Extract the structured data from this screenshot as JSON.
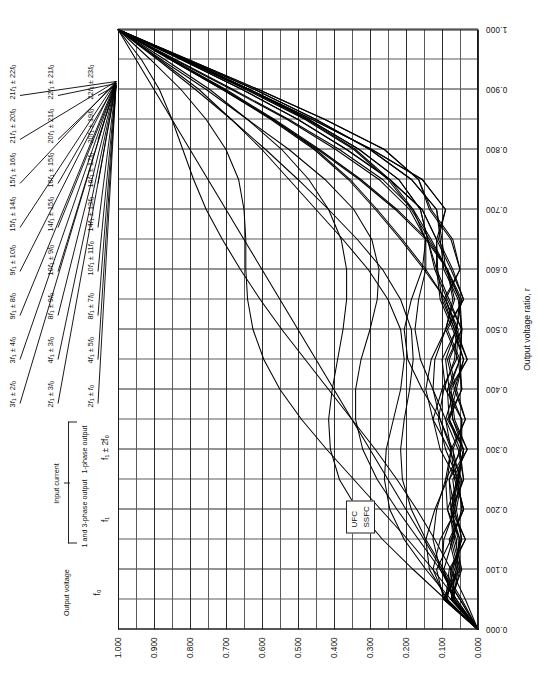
{
  "figure": {
    "orientation": "rotated-90",
    "background": "#ffffff",
    "line_color": "#000000",
    "grid_color": "#5a5a5a"
  },
  "header": {
    "output_voltage_title": "Output\noutput voltage",
    "output_voltage_label": "Output voltage",
    "output_voltage_symbol": "f₀",
    "input_current_label": "Input current",
    "input_current_col1_label": "1 and 3-phase output",
    "input_current_col1_symbol": "f₁",
    "input_current_col2_label": "1-phase output",
    "input_current_col2_symbol": "f₁ ± 2f₀"
  },
  "legend_box": {
    "line1": "UFC",
    "line2": "SSFC"
  },
  "axes": {
    "x_title": "Output voltage ratio, r",
    "x_ticks": [
      "0.000",
      "0.100",
      "0.200",
      "0.300",
      "0.400",
      "0.500",
      "0.600",
      "0.700",
      "0.800",
      "0.900",
      "1.000"
    ],
    "y_ticks": [
      "0.000",
      "0.100",
      "0.200",
      "0.300",
      "0.400",
      "0.500",
      "0.600",
      "0.700",
      "0.800",
      "0.900",
      "1.000"
    ],
    "x_range": [
      0,
      1
    ],
    "y_range": [
      0,
      1
    ]
  },
  "component_labels": {
    "column_left": [
      "3f₁ ± 2f₀",
      "3f₁ ± 4f₀",
      "9f₁ ± 8f₀",
      "9f₁ ± 10f₀",
      "15f₁ ± 14f₀",
      "15f₁ ± 16f₀",
      "21f₁ ± 20f₀",
      "21f₁ ± 22f₀"
    ],
    "column_middle": [
      "2f₁ ± 3f₀",
      "4f₁ ± 3f₀",
      "8f₁ ± 9f₀",
      "10f₁ ± 9f₀",
      "14f₁ ± 15f₀",
      "16f₁ ± 15f₀",
      "20f₁ ± 21f₀",
      "22f₁ ± 21f₀"
    ],
    "column_right": [
      "2f₁ ± f₀",
      "4f₁ ± 5f₀",
      "8f₁ ± 7f₀",
      "10f₁ ± 11f₀",
      "14f₁ ± 13f₀",
      "16f₁ ± 17f₀",
      "20f₁ ± 19f₀",
      "22f₁ ± 23f₀"
    ]
  },
  "chart_data": {
    "type": "line",
    "title": "",
    "xlabel": "Output voltage ratio, r",
    "ylabel": "",
    "xlim": [
      0,
      1
    ],
    "ylim": [
      0,
      1
    ],
    "grid": true,
    "legend": [
      "UFC",
      "SSFC"
    ],
    "x": [
      0.0,
      0.05,
      0.1,
      0.15,
      0.2,
      0.25,
      0.3,
      0.35,
      0.4,
      0.45,
      0.5,
      0.55,
      0.6,
      0.65,
      0.7,
      0.75,
      0.8,
      0.85,
      0.9,
      0.95,
      1.0
    ],
    "series": [
      {
        "name": "Output voltage f0 (fundamental, SSFC straight line)",
        "values": [
          0.0,
          0.05,
          0.1,
          0.15,
          0.2,
          0.25,
          0.3,
          0.35,
          0.4,
          0.45,
          0.5,
          0.55,
          0.6,
          0.65,
          0.7,
          0.75,
          0.8,
          0.85,
          0.9,
          0.95,
          1.0
        ]
      },
      {
        "name": "2f1 +/- f0",
        "values": [
          0.0,
          0.035,
          0.075,
          0.12,
          0.17,
          0.225,
          0.285,
          0.35,
          0.415,
          0.48,
          0.545,
          0.605,
          0.66,
          0.71,
          0.755,
          0.79,
          0.82,
          0.85,
          0.885,
          0.935,
          1.0
        ]
      },
      {
        "name": "2f1 +/- 3f0",
        "values": [
          0.0,
          0.06,
          0.125,
          0.195,
          0.27,
          0.345,
          0.42,
          0.49,
          0.55,
          0.595,
          0.625,
          0.64,
          0.645,
          0.645,
          0.65,
          0.665,
          0.7,
          0.755,
          0.825,
          0.91,
          1.0
        ]
      },
      {
        "name": "3f1 +/- 2f0",
        "values": [
          0.0,
          0.09,
          0.18,
          0.265,
          0.335,
          0.385,
          0.41,
          0.415,
          0.405,
          0.39,
          0.375,
          0.365,
          0.365,
          0.38,
          0.415,
          0.47,
          0.545,
          0.64,
          0.745,
          0.87,
          1.0
        ]
      },
      {
        "name": "3f1 +/- 4f0",
        "values": [
          0.0,
          0.05,
          0.105,
          0.165,
          0.225,
          0.28,
          0.32,
          0.34,
          0.34,
          0.325,
          0.3,
          0.28,
          0.275,
          0.295,
          0.345,
          0.425,
          0.525,
          0.64,
          0.755,
          0.88,
          1.0
        ]
      },
      {
        "name": "4f1 +/- 3f0",
        "values": [
          0.0,
          0.075,
          0.145,
          0.205,
          0.245,
          0.26,
          0.255,
          0.235,
          0.215,
          0.205,
          0.215,
          0.25,
          0.305,
          0.375,
          0.45,
          0.525,
          0.6,
          0.685,
          0.775,
          0.885,
          1.0
        ]
      },
      {
        "name": "4f1 +/- 5f0",
        "values": [
          0.0,
          0.045,
          0.095,
          0.145,
          0.185,
          0.21,
          0.215,
          0.205,
          0.19,
          0.18,
          0.185,
          0.215,
          0.265,
          0.335,
          0.415,
          0.5,
          0.59,
          0.685,
          0.785,
          0.89,
          1.0
        ]
      },
      {
        "name": "8f1 +/- 7f0",
        "values": [
          0.0,
          0.085,
          0.135,
          0.145,
          0.12,
          0.085,
          0.075,
          0.105,
          0.155,
          0.195,
          0.205,
          0.185,
          0.155,
          0.145,
          0.18,
          0.265,
          0.385,
          0.525,
          0.68,
          0.84,
          1.0
        ]
      },
      {
        "name": "8f1 +/- 9f0",
        "values": [
          0.0,
          0.06,
          0.105,
          0.125,
          0.115,
          0.09,
          0.075,
          0.09,
          0.125,
          0.16,
          0.175,
          0.165,
          0.145,
          0.145,
          0.19,
          0.275,
          0.395,
          0.53,
          0.685,
          0.845,
          1.0
        ]
      },
      {
        "name": "9f1 +/- 8f0",
        "values": [
          0.0,
          0.09,
          0.125,
          0.105,
          0.06,
          0.045,
          0.08,
          0.125,
          0.145,
          0.13,
          0.09,
          0.065,
          0.085,
          0.145,
          0.23,
          0.33,
          0.445,
          0.57,
          0.705,
          0.85,
          1.0
        ]
      },
      {
        "name": "9f1 +/- 10f0",
        "values": [
          0.0,
          0.065,
          0.1,
          0.095,
          0.065,
          0.05,
          0.07,
          0.105,
          0.125,
          0.12,
          0.09,
          0.07,
          0.085,
          0.14,
          0.225,
          0.325,
          0.44,
          0.565,
          0.7,
          0.85,
          1.0
        ]
      },
      {
        "name": "10f1 +/- 9f0",
        "values": [
          0.0,
          0.095,
          0.115,
          0.075,
          0.04,
          0.06,
          0.105,
          0.125,
          0.1,
          0.06,
          0.055,
          0.09,
          0.15,
          0.215,
          0.285,
          0.36,
          0.455,
          0.575,
          0.71,
          0.855,
          1.0
        ]
      },
      {
        "name": "10f1 +/- 11f0",
        "values": [
          0.0,
          0.07,
          0.095,
          0.07,
          0.045,
          0.055,
          0.09,
          0.11,
          0.095,
          0.065,
          0.06,
          0.09,
          0.145,
          0.21,
          0.28,
          0.355,
          0.45,
          0.57,
          0.71,
          0.855,
          1.0
        ]
      },
      {
        "name": "14f1 +/- 13f0",
        "values": [
          0.0,
          0.095,
          0.065,
          0.05,
          0.085,
          0.09,
          0.045,
          0.045,
          0.09,
          0.1,
          0.06,
          0.045,
          0.085,
          0.135,
          0.185,
          0.25,
          0.345,
          0.48,
          0.645,
          0.82,
          1.0
        ]
      },
      {
        "name": "14f1 +/- 15f0",
        "values": [
          0.0,
          0.075,
          0.06,
          0.05,
          0.075,
          0.08,
          0.05,
          0.045,
          0.08,
          0.09,
          0.06,
          0.05,
          0.085,
          0.13,
          0.18,
          0.245,
          0.34,
          0.475,
          0.64,
          0.82,
          1.0
        ]
      },
      {
        "name": "15f1 +/- 14f0",
        "values": [
          0.0,
          0.09,
          0.055,
          0.06,
          0.085,
          0.055,
          0.04,
          0.08,
          0.085,
          0.05,
          0.045,
          0.085,
          0.12,
          0.14,
          0.16,
          0.22,
          0.33,
          0.47,
          0.635,
          0.815,
          1.0
        ]
      },
      {
        "name": "15f1 +/- 16f0",
        "values": [
          0.0,
          0.07,
          0.05,
          0.055,
          0.075,
          0.055,
          0.04,
          0.07,
          0.08,
          0.05,
          0.045,
          0.08,
          0.115,
          0.14,
          0.16,
          0.22,
          0.33,
          0.47,
          0.635,
          0.815,
          1.0
        ]
      },
      {
        "name": "16f1 +/- 15f0",
        "values": [
          0.0,
          0.095,
          0.05,
          0.07,
          0.075,
          0.04,
          0.055,
          0.09,
          0.065,
          0.04,
          0.07,
          0.105,
          0.115,
          0.115,
          0.155,
          0.245,
          0.365,
          0.5,
          0.655,
          0.825,
          1.0
        ]
      },
      {
        "name": "16f1 +/- 17f0",
        "values": [
          0.0,
          0.075,
          0.045,
          0.065,
          0.07,
          0.04,
          0.05,
          0.08,
          0.06,
          0.04,
          0.065,
          0.1,
          0.112,
          0.115,
          0.155,
          0.245,
          0.365,
          0.5,
          0.655,
          0.825,
          1.0
        ]
      },
      {
        "name": "20f1 +/- 19f0",
        "values": [
          0.0,
          0.09,
          0.06,
          0.08,
          0.04,
          0.065,
          0.075,
          0.035,
          0.065,
          0.085,
          0.045,
          0.055,
          0.095,
          0.105,
          0.115,
          0.185,
          0.3,
          0.45,
          0.62,
          0.81,
          1.0
        ]
      },
      {
        "name": "20f1 +/- 21f0",
        "values": [
          0.0,
          0.07,
          0.055,
          0.075,
          0.04,
          0.06,
          0.07,
          0.035,
          0.06,
          0.08,
          0.045,
          0.05,
          0.09,
          0.1,
          0.115,
          0.185,
          0.3,
          0.45,
          0.62,
          0.81,
          1.0
        ]
      },
      {
        "name": "21f1 +/- 20f0",
        "values": [
          0.0,
          0.085,
          0.075,
          0.045,
          0.065,
          0.08,
          0.03,
          0.07,
          0.08,
          0.03,
          0.065,
          0.095,
          0.05,
          0.075,
          0.135,
          0.165,
          0.26,
          0.425,
          0.61,
          0.805,
          1.0
        ]
      },
      {
        "name": "21f1 +/- 22f0",
        "values": [
          0.0,
          0.065,
          0.07,
          0.045,
          0.06,
          0.07,
          0.03,
          0.065,
          0.075,
          0.03,
          0.06,
          0.09,
          0.05,
          0.07,
          0.13,
          0.165,
          0.26,
          0.425,
          0.61,
          0.805,
          1.0
        ]
      },
      {
        "name": "22f1 +/- 21f0",
        "values": [
          0.0,
          0.09,
          0.08,
          0.035,
          0.075,
          0.06,
          0.04,
          0.085,
          0.045,
          0.055,
          0.09,
          0.04,
          0.075,
          0.115,
          0.09,
          0.155,
          0.295,
          0.46,
          0.635,
          0.815,
          1.0
        ]
      },
      {
        "name": "22f1 +/- 23f0",
        "values": [
          0.0,
          0.07,
          0.075,
          0.035,
          0.07,
          0.055,
          0.04,
          0.08,
          0.045,
          0.05,
          0.085,
          0.04,
          0.07,
          0.11,
          0.09,
          0.155,
          0.295,
          0.46,
          0.635,
          0.815,
          1.0
        ]
      }
    ]
  }
}
